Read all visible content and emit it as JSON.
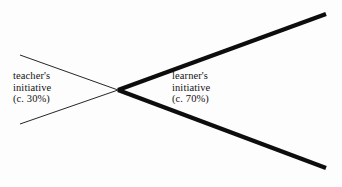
{
  "diagram": {
    "background_color": "#fdfdfd",
    "line_color": "#0d0d0d",
    "labels": {
      "teacher": {
        "line1": "teacher's",
        "line2": "initiative",
        "line3": "(c. 30%)"
      },
      "learner": {
        "line1": "learner's",
        "line2": "initiative",
        "line3": "(c. 70%)"
      }
    },
    "geometry": {
      "crossing_point": {
        "x": 118,
        "y": 90
      },
      "thin_upper_start": {
        "x": 20,
        "y": 55
      },
      "thin_lower_start": {
        "x": 20,
        "y": 124
      },
      "thick_upper_end": {
        "x": 326,
        "y": 14
      },
      "thick_lower_end": {
        "x": 326,
        "y": 168
      },
      "thin_stroke_width": 0.9,
      "thick_stroke_width": 4.2
    }
  },
  "chart_data": {
    "type": "line",
    "xlabel": "",
    "ylabel": "",
    "series": [
      {
        "name": "teacher's initiative (c. 30%)",
        "style": "thin",
        "description": "Wedge narrowing from left to the crossing point",
        "points": [
          {
            "x": 20,
            "y": 55
          },
          {
            "x": 118,
            "y": 90
          },
          {
            "x": 20,
            "y": 124
          }
        ],
        "share_percent": 30
      },
      {
        "name": "learner's initiative (c. 70%)",
        "style": "thick",
        "description": "Wedge widening from the crossing point to the right",
        "points": [
          {
            "x": 326,
            "y": 14
          },
          {
            "x": 118,
            "y": 90
          },
          {
            "x": 326,
            "y": 168
          }
        ],
        "share_percent": 70
      }
    ],
    "annotations": [
      {
        "text": "teacher's initiative (c. 30%)",
        "x": 13,
        "y": 70
      },
      {
        "text": "learner's initiative (c. 70%)",
        "x": 172,
        "y": 70
      }
    ],
    "grid": false,
    "legend": "none"
  }
}
